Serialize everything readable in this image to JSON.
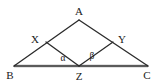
{
  "figure": {
    "type": "geometry-diagram",
    "width": 160,
    "height": 83,
    "background_color": "#ffffff",
    "stroke_color": "#2b2b2b",
    "base_highlight_color": "#8a8a8a"
  },
  "points": {
    "A": {
      "label": "A",
      "x": 79,
      "y": 20,
      "label_x": 79,
      "label_y": 11
    },
    "X": {
      "label": "X",
      "x": 46,
      "y": 42,
      "label_x": 35,
      "label_y": 39
    },
    "Y": {
      "label": "Y",
      "x": 113,
      "y": 42,
      "label_x": 122,
      "label_y": 39
    },
    "B": {
      "label": "B",
      "x": 14,
      "y": 66,
      "label_x": 10,
      "label_y": 75
    },
    "Z": {
      "label": "Z",
      "x": 79,
      "y": 66,
      "label_x": 79,
      "label_y": 76
    },
    "C": {
      "label": "C",
      "x": 148,
      "y": 66,
      "label_x": 147,
      "label_y": 75
    }
  },
  "angles": {
    "alpha": {
      "label": "α",
      "vertex": "Z",
      "label_x": 63,
      "label_y": 59
    },
    "beta": {
      "label": "β",
      "vertex": "Z",
      "label_x": 92,
      "label_y": 57
    }
  },
  "segments": [
    {
      "name": "B-A",
      "from": "B",
      "to": "A",
      "style": "solid"
    },
    {
      "name": "A-C",
      "from": "A",
      "to": "C",
      "style": "solid"
    },
    {
      "name": "B-C",
      "from": "B",
      "to": "C",
      "style": "solid"
    },
    {
      "name": "X-Z",
      "from": "X",
      "to": "Z",
      "style": "solid"
    },
    {
      "name": "Z-Y",
      "from": "Z",
      "to": "Y",
      "style": "solid"
    }
  ]
}
